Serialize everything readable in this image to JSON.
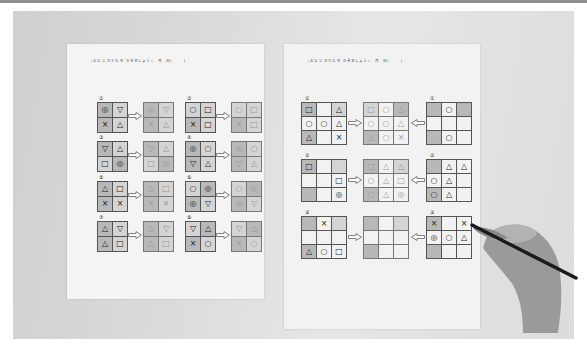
{
  "scene": {
    "description": "Photograph of two Japanese shape-copying worksheets with a hand holding a pencil",
    "sheet_header": "☆おなじ かたち を かきましょう☆　月　日(　　　)"
  },
  "left_sheet": {
    "header": "☆おなじ かたち を かきましょう☆　月　日(　　　)",
    "exercises": [
      {
        "num": "①",
        "cells": [
          "◎",
          "▽",
          "×",
          "△"
        ],
        "copy": [
          "◎",
          "▽",
          "×",
          "△"
        ]
      },
      {
        "num": "②",
        "cells": [
          "○",
          "□",
          "×",
          "□"
        ],
        "copy": [
          "○",
          "□",
          "×",
          "□"
        ]
      },
      {
        "num": "③",
        "cells": [
          "▽",
          "△",
          "□",
          "◎"
        ],
        "copy": [
          "▽",
          "△",
          "□",
          "◎"
        ]
      },
      {
        "num": "④",
        "cells": [
          "◎",
          "○",
          "▽",
          "△"
        ],
        "copy": [
          "◎",
          "○",
          "▽",
          "△"
        ]
      },
      {
        "num": "⑤",
        "cells": [
          "△",
          "□",
          "×",
          "×"
        ],
        "copy": [
          "△",
          "□",
          "×",
          "×"
        ]
      },
      {
        "num": "⑥",
        "cells": [
          "○",
          "◎",
          "◎",
          "▽"
        ],
        "copy": [
          "○",
          "◎",
          "◎",
          "▽"
        ]
      },
      {
        "num": "⑦",
        "cells": [
          "△",
          "▽",
          "△",
          "□"
        ],
        "copy": [
          "△",
          "▽",
          "△",
          "□"
        ]
      },
      {
        "num": "⑧",
        "cells": [
          "▽",
          "△",
          "×",
          "○"
        ],
        "copy": [
          "▽",
          "△",
          "×",
          "○"
        ]
      }
    ]
  },
  "right_sheet": {
    "header": "☆おなじ かたち を かきましょう☆　月　日(　　　)",
    "rows": [
      {
        "num": "①",
        "source": [
          "□",
          "",
          "△",
          "○",
          "○",
          "△",
          "△",
          "",
          "×"
        ],
        "copy": [
          "□",
          "○",
          "△",
          "○",
          "○",
          "△",
          "△",
          "○",
          "×"
        ],
        "target_num": "①",
        "target": [
          "",
          "○",
          "",
          "",
          "",
          "",
          "",
          "○",
          ""
        ]
      },
      {
        "num": "②",
        "source": [
          "□",
          "",
          "",
          "",
          "",
          "□",
          "",
          "",
          "◎"
        ],
        "copy": [
          "□",
          "△",
          "△",
          "○",
          "△",
          "□",
          "○",
          "△",
          "◎"
        ],
        "target_num": "②",
        "target": [
          "",
          "△",
          "△",
          "○",
          "△",
          "",
          "○",
          "△",
          ""
        ]
      },
      {
        "num": "③",
        "source": [
          "",
          "×",
          "",
          "",
          "",
          "",
          "△",
          "○",
          "□"
        ],
        "copy": [
          "",
          "",
          "",
          "",
          "",
          "",
          "",
          "",
          ""
        ],
        "target_num": "③",
        "target": [
          "×",
          "",
          "×",
          "◎",
          "○",
          "△",
          "",
          "",
          ""
        ]
      }
    ]
  }
}
